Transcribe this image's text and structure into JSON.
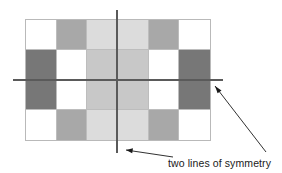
{
  "figure": {
    "caption": "two lines of symmetry",
    "grid": {
      "columns": 6,
      "rows": 4,
      "border_color": "#b9b9b9",
      "palette": {
        "white": "#ffffff",
        "light": "#dcdcdc",
        "light_mid": "#c8c8c8",
        "medium": "#a8a8a8",
        "dark": "#777777"
      },
      "cells": [
        [
          "white",
          "medium",
          "light",
          "light",
          "medium",
          "white"
        ],
        [
          "dark",
          "white",
          "light_mid",
          "light_mid",
          "white",
          "dark"
        ],
        [
          "dark",
          "white",
          "light_mid",
          "light_mid",
          "white",
          "dark"
        ],
        [
          "white",
          "medium",
          "light",
          "light",
          "medium",
          "white"
        ]
      ]
    },
    "symmetry_lines": [
      {
        "name": "vertical-line-of-symmetry",
        "orientation": "vertical",
        "color": "#5a5a5a"
      },
      {
        "name": "horizontal-line-of-symmetry",
        "orientation": "horizontal",
        "color": "#5a5a5a"
      }
    ],
    "arrows": [
      {
        "name": "arrow-to-vertical-line",
        "points_to": "vertical line of symmetry",
        "color": "#1a1a1a"
      },
      {
        "name": "arrow-to-horizontal-line",
        "points_to": "horizontal line of symmetry",
        "color": "#1a1a1a"
      }
    ]
  }
}
